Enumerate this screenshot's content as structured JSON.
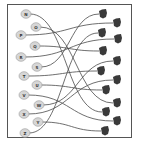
{
  "diagram": {
    "type": "matching",
    "colors": {
      "frame": "#555555",
      "left_node": "#d6d6d6",
      "right_node": "#3a3a3a",
      "line": "#4a4a4a"
    },
    "left_nodes": [
      {
        "label": "N",
        "x": 26,
        "y": 14
      },
      {
        "label": "O",
        "x": 36,
        "y": 27
      },
      {
        "label": "P",
        "x": 21,
        "y": 35
      },
      {
        "label": "Q",
        "x": 35,
        "y": 46
      },
      {
        "label": "R",
        "x": 21,
        "y": 57
      },
      {
        "label": "S",
        "x": 37,
        "y": 67
      },
      {
        "label": "T",
        "x": 24,
        "y": 76
      },
      {
        "label": "U",
        "x": 37,
        "y": 85
      },
      {
        "label": "V",
        "x": 24,
        "y": 95
      },
      {
        "label": "W",
        "x": 39,
        "y": 105
      },
      {
        "label": "X",
        "x": 24,
        "y": 114
      },
      {
        "label": "Y",
        "x": 38,
        "y": 122
      },
      {
        "label": "Z",
        "x": 25,
        "y": 133
      }
    ],
    "right_nodes": [
      {
        "id": "r1",
        "x": 103,
        "y": 14
      },
      {
        "id": "r2",
        "x": 117,
        "y": 23
      },
      {
        "id": "r3",
        "x": 102,
        "y": 33
      },
      {
        "id": "r4",
        "x": 118,
        "y": 39
      },
      {
        "id": "r5",
        "x": 103,
        "y": 51
      },
      {
        "id": "r6",
        "x": 117,
        "y": 61
      },
      {
        "id": "r7",
        "x": 101,
        "y": 71
      },
      {
        "id": "r8",
        "x": 117,
        "y": 80
      },
      {
        "id": "r9",
        "x": 106,
        "y": 90
      },
      {
        "id": "r10",
        "x": 117,
        "y": 103
      },
      {
        "id": "r11",
        "x": 106,
        "y": 112
      },
      {
        "id": "r12",
        "x": 117,
        "y": 121
      },
      {
        "id": "r13",
        "x": 105,
        "y": 131
      }
    ],
    "links": [
      {
        "from": "N",
        "to": "r11"
      },
      {
        "from": "O",
        "to": "r10"
      },
      {
        "from": "P",
        "to": "r2"
      },
      {
        "from": "Q",
        "to": "r5"
      },
      {
        "from": "R",
        "to": "r4"
      },
      {
        "from": "S",
        "to": "r1"
      },
      {
        "from": "T",
        "to": "r7"
      },
      {
        "from": "U",
        "to": "r9"
      },
      {
        "from": "V",
        "to": "r12"
      },
      {
        "from": "W",
        "to": "r6"
      },
      {
        "from": "X",
        "to": "r8"
      },
      {
        "from": "Y",
        "to": "r13"
      },
      {
        "from": "Z",
        "to": "r3"
      }
    ]
  }
}
